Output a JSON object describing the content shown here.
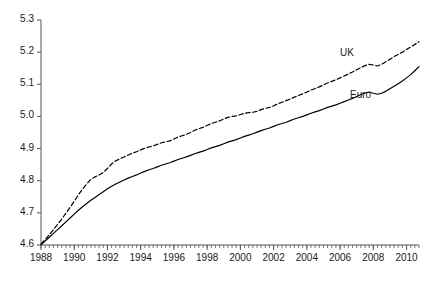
{
  "chart_data": {
    "type": "line",
    "title": "",
    "xlabel": "",
    "ylabel": "",
    "xlim": [
      1988.0,
      2010.75
    ],
    "ylim": [
      4.6,
      5.3
    ],
    "grid": false,
    "legend_position": "inline-annotation",
    "y_ticks": [
      "4.6",
      "4.7",
      "4.8",
      "4.9",
      "5.0",
      "5.1",
      "5.2",
      "5.3"
    ],
    "y_tick_values": [
      4.6,
      4.7,
      4.8,
      4.9,
      5.0,
      5.1,
      5.2,
      5.3
    ],
    "x_ticks": [
      "1988",
      "1990",
      "1992",
      "1994",
      "1996",
      "1998",
      "2000",
      "2002",
      "2004",
      "2006",
      "2008",
      "2010"
    ],
    "x_tick_values": [
      1988,
      1990,
      1992,
      1994,
      1996,
      1998,
      2000,
      2002,
      2004,
      2006,
      2008,
      2010
    ],
    "x_minor_tick_step": 0.25,
    "annotations": [
      {
        "name": "uk-label",
        "text": "UK",
        "x": 2006.0,
        "y": 5.195
      },
      {
        "name": "euro-label",
        "text": "Euro",
        "x": 2006.6,
        "y": 5.065
      }
    ],
    "series": [
      {
        "name": "UK",
        "style": "dashed",
        "color": "#000000",
        "x": [
          1988.0,
          1988.25,
          1988.5,
          1988.75,
          1989.0,
          1989.25,
          1989.5,
          1989.75,
          1990.0,
          1990.25,
          1990.5,
          1990.75,
          1991.0,
          1991.25,
          1991.5,
          1991.75,
          1992.0,
          1992.25,
          1992.5,
          1992.75,
          1993.0,
          1993.25,
          1993.5,
          1993.75,
          1994.0,
          1994.25,
          1994.5,
          1994.75,
          1995.0,
          1995.25,
          1995.5,
          1995.75,
          1996.0,
          1996.25,
          1996.5,
          1996.75,
          1997.0,
          1997.25,
          1997.5,
          1997.75,
          1998.0,
          1998.25,
          1998.5,
          1998.75,
          1999.0,
          1999.25,
          1999.5,
          1999.75,
          2000.0,
          2000.25,
          2000.5,
          2000.75,
          2001.0,
          2001.25,
          2001.5,
          2001.75,
          2002.0,
          2002.25,
          2002.5,
          2002.75,
          2003.0,
          2003.25,
          2003.5,
          2003.75,
          2004.0,
          2004.25,
          2004.5,
          2004.75,
          2005.0,
          2005.25,
          2005.5,
          2005.75,
          2006.0,
          2006.25,
          2006.5,
          2006.75,
          2007.0,
          2007.25,
          2007.5,
          2007.75,
          2008.0,
          2008.25,
          2008.5,
          2008.75,
          2009.0,
          2009.25,
          2009.5,
          2009.75,
          2010.0,
          2010.25,
          2010.5,
          2010.75
        ],
        "values": [
          4.603,
          4.617,
          4.632,
          4.648,
          4.664,
          4.681,
          4.699,
          4.717,
          4.736,
          4.756,
          4.774,
          4.79,
          4.804,
          4.812,
          4.818,
          4.826,
          4.838,
          4.852,
          4.862,
          4.868,
          4.874,
          4.88,
          4.886,
          4.89,
          4.896,
          4.901,
          4.905,
          4.908,
          4.913,
          4.918,
          4.921,
          4.924,
          4.93,
          4.936,
          4.94,
          4.944,
          4.95,
          4.957,
          4.962,
          4.966,
          4.972,
          4.978,
          4.982,
          4.986,
          4.992,
          4.997,
          5.0,
          5.002,
          5.006,
          5.01,
          5.012,
          5.013,
          5.016,
          5.021,
          5.025,
          5.028,
          5.033,
          5.039,
          5.044,
          5.049,
          5.054,
          5.06,
          5.065,
          5.07,
          5.076,
          5.082,
          5.087,
          5.092,
          5.098,
          5.104,
          5.109,
          5.114,
          5.12,
          5.126,
          5.132,
          5.138,
          5.145,
          5.152,
          5.158,
          5.162,
          5.16,
          5.157,
          5.162,
          5.17,
          5.178,
          5.186,
          5.193,
          5.2,
          5.208,
          5.216,
          5.224,
          5.232
        ]
      },
      {
        "name": "Euro",
        "style": "solid",
        "color": "#000000",
        "x": [
          1988.0,
          1988.25,
          1988.5,
          1988.75,
          1989.0,
          1989.25,
          1989.5,
          1989.75,
          1990.0,
          1990.25,
          1990.5,
          1990.75,
          1991.0,
          1991.25,
          1991.5,
          1991.75,
          1992.0,
          1992.25,
          1992.5,
          1992.75,
          1993.0,
          1993.25,
          1993.5,
          1993.75,
          1994.0,
          1994.25,
          1994.5,
          1994.75,
          1995.0,
          1995.25,
          1995.5,
          1995.75,
          1996.0,
          1996.25,
          1996.5,
          1996.75,
          1997.0,
          1997.25,
          1997.5,
          1997.75,
          1998.0,
          1998.25,
          1998.5,
          1998.75,
          1999.0,
          1999.25,
          1999.5,
          1999.75,
          2000.0,
          2000.25,
          2000.5,
          2000.75,
          2001.0,
          2001.25,
          2001.5,
          2001.75,
          2002.0,
          2002.25,
          2002.5,
          2002.75,
          2003.0,
          2003.25,
          2003.5,
          2003.75,
          2004.0,
          2004.25,
          2004.5,
          2004.75,
          2005.0,
          2005.25,
          2005.5,
          2005.75,
          2006.0,
          2006.25,
          2006.5,
          2006.75,
          2007.0,
          2007.25,
          2007.5,
          2007.75,
          2008.0,
          2008.25,
          2008.5,
          2008.75,
          2009.0,
          2009.25,
          2009.5,
          2009.75,
          2010.0,
          2010.25,
          2010.5,
          2010.75
        ],
        "values": [
          4.601,
          4.612,
          4.624,
          4.636,
          4.648,
          4.66,
          4.672,
          4.684,
          4.696,
          4.708,
          4.719,
          4.729,
          4.739,
          4.748,
          4.757,
          4.766,
          4.775,
          4.783,
          4.79,
          4.796,
          4.802,
          4.808,
          4.813,
          4.818,
          4.824,
          4.829,
          4.834,
          4.838,
          4.843,
          4.848,
          4.852,
          4.856,
          4.861,
          4.866,
          4.87,
          4.874,
          4.879,
          4.884,
          4.888,
          4.892,
          4.897,
          4.902,
          4.906,
          4.91,
          4.915,
          4.92,
          4.924,
          4.928,
          4.933,
          4.938,
          4.942,
          4.946,
          4.951,
          4.956,
          4.96,
          4.964,
          4.969,
          4.974,
          4.978,
          4.982,
          4.987,
          4.992,
          4.996,
          5.0,
          5.005,
          5.01,
          5.014,
          5.018,
          5.023,
          5.028,
          5.032,
          5.036,
          5.041,
          5.046,
          5.051,
          5.056,
          5.062,
          5.068,
          5.073,
          5.076,
          5.072,
          5.069,
          5.072,
          5.078,
          5.086,
          5.094,
          5.102,
          5.11,
          5.12,
          5.13,
          5.142,
          5.155
        ]
      }
    ]
  },
  "axes": {
    "left_axis_name": "y-axis",
    "bottom_axis_name": "x-axis"
  }
}
